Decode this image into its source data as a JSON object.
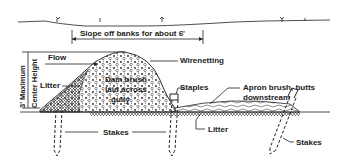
{
  "diagram": {
    "type": "brush dam cross-section",
    "labels": {
      "slope": "Slope off banks for about 6'",
      "flow": "Flow",
      "height_1": "3' Maximum",
      "height_2": "Center Height",
      "litter_left": "Litter",
      "dam_1": "Dam brush",
      "dam_2": "laid across",
      "dam_3": "gully",
      "wirenetting": "Wirenetting",
      "staples": "Staples",
      "apron_1": "Apron brush, butts",
      "apron_2": "downstream",
      "stakes_left": "Stakes",
      "litter_bottom": "Litter",
      "stakes_right": "Stakes"
    },
    "colors": {
      "ink": "#222222",
      "background": "#ffffff"
    }
  }
}
